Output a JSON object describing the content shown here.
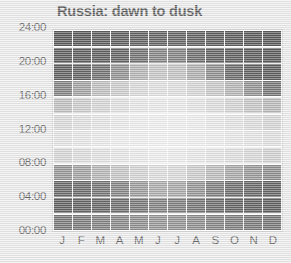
{
  "chart_data": {
    "type": "heatmap",
    "title": "Russia: dawn to dusk",
    "xlabel": "",
    "ylabel": "",
    "grid": false,
    "legend": "none",
    "categories": [
      "J",
      "F",
      "M",
      "A",
      "M",
      "J",
      "J",
      "A",
      "S",
      "O",
      "N",
      "D"
    ],
    "month_names": [
      "January",
      "February",
      "March",
      "April",
      "May",
      "June",
      "July",
      "August",
      "September",
      "October",
      "November",
      "December"
    ],
    "ytick_labels": [
      "00:00",
      "04:00",
      "08:00",
      "12:00",
      "16:00",
      "20:00",
      "24:00"
    ],
    "ytick_values": [
      0,
      4,
      8,
      12,
      16,
      20,
      24
    ],
    "ylim": [
      0,
      24
    ],
    "row_bins": [
      "22:00-24:00",
      "20:00-22:00",
      "18:00-20:00",
      "16:00-18:00",
      "14:00-16:00",
      "12:00-14:00",
      "10:00-12:00",
      "08:00-10:00",
      "06:00-08:00",
      "04:00-06:00",
      "02:00-04:00",
      "00:00-02:00"
    ],
    "value_meaning": "darkness level: 0 = full daylight (white), 100 = full night (black)",
    "colors": {
      "background": "#e9e9e9",
      "plot_background": "#ffffff",
      "title_color": "#1b1b1b",
      "axis_text": "#2b2b2b",
      "frame": "#cfcfcf",
      "night": "#101010",
      "day": "#f5f5f5"
    },
    "series": [
      {
        "name": "January",
        "values": [
          97,
          95,
          93,
          72,
          34,
          18,
          12,
          20,
          60,
          88,
          92,
          78
        ]
      },
      {
        "name": "February",
        "values": [
          96,
          94,
          90,
          52,
          26,
          14,
          10,
          16,
          52,
          86,
          90,
          76
        ]
      },
      {
        "name": "March",
        "values": [
          95,
          93,
          82,
          34,
          20,
          11,
          8,
          13,
          40,
          80,
          88,
          72
        ]
      },
      {
        "name": "April",
        "values": [
          94,
          90,
          62,
          26,
          14,
          8,
          6,
          10,
          30,
          70,
          84,
          68
        ]
      },
      {
        "name": "May",
        "values": [
          92,
          82,
          40,
          18,
          10,
          6,
          5,
          8,
          22,
          56,
          78,
          64
        ]
      },
      {
        "name": "June",
        "values": [
          90,
          70,
          30,
          14,
          8,
          5,
          4,
          6,
          16,
          46,
          72,
          60
        ]
      },
      {
        "name": "July",
        "values": [
          90,
          72,
          32,
          15,
          8,
          5,
          4,
          7,
          18,
          48,
          74,
          61
        ]
      },
      {
        "name": "August",
        "values": [
          92,
          84,
          44,
          20,
          11,
          6,
          5,
          9,
          26,
          60,
          80,
          65
        ]
      },
      {
        "name": "September",
        "values": [
          94,
          91,
          64,
          28,
          16,
          9,
          7,
          12,
          36,
          74,
          86,
          70
        ]
      },
      {
        "name": "October",
        "values": [
          95,
          93,
          86,
          40,
          22,
          12,
          9,
          15,
          48,
          84,
          90,
          74
        ]
      },
      {
        "name": "November",
        "values": [
          96,
          95,
          92,
          62,
          30,
          16,
          11,
          19,
          58,
          88,
          92,
          77
        ]
      },
      {
        "name": "December",
        "values": [
          97,
          96,
          94,
          80,
          38,
          20,
          14,
          23,
          64,
          90,
          93,
          79
        ]
      }
    ]
  }
}
